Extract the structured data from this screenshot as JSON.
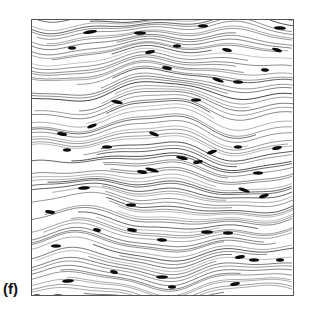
{
  "figure": {
    "panel_label": "(f)",
    "colors": {
      "line": "#3a3a3a",
      "marker": "#0a0a0a",
      "background": "#ffffff",
      "frame": "#555555"
    },
    "streamline_count": 95,
    "markers": [
      [
        58,
        12,
        14,
        -2
      ],
      [
        108,
        13,
        12,
        0
      ],
      [
        171,
        6,
        10,
        0
      ],
      [
        248,
        8,
        12,
        1
      ],
      [
        145,
        26,
        8,
        0
      ],
      [
        118,
        32,
        10,
        -3
      ],
      [
        195,
        30,
        10,
        3
      ],
      [
        40,
        28,
        8,
        0
      ],
      [
        245,
        30,
        10,
        4
      ],
      [
        135,
        48,
        10,
        2
      ],
      [
        233,
        50,
        8,
        1
      ],
      [
        186,
        60,
        12,
        5
      ],
      [
        206,
        62,
        10,
        1
      ],
      [
        85,
        82,
        12,
        3
      ],
      [
        164,
        80,
        10,
        0
      ],
      [
        60,
        106,
        10,
        -5
      ],
      [
        30,
        114,
        10,
        2
      ],
      [
        122,
        114,
        10,
        5
      ],
      [
        75,
        127,
        10,
        0
      ],
      [
        35,
        130,
        8,
        0
      ],
      [
        180,
        132,
        10,
        -4
      ],
      [
        206,
        127,
        8,
        0
      ],
      [
        245,
        128,
        10,
        -3
      ],
      [
        120,
        150,
        14,
        4
      ],
      [
        150,
        138,
        12,
        3
      ],
      [
        166,
        142,
        10,
        -2
      ],
      [
        110,
        152,
        10,
        2
      ],
      [
        226,
        153,
        10,
        0
      ],
      [
        52,
        168,
        12,
        -1
      ],
      [
        18,
        192,
        10,
        2
      ],
      [
        99,
        185,
        10,
        0
      ],
      [
        212,
        170,
        12,
        5
      ],
      [
        232,
        176,
        10,
        -4
      ],
      [
        65,
        210,
        8,
        3
      ],
      [
        100,
        210,
        10,
        2
      ],
      [
        130,
        220,
        10,
        1
      ],
      [
        175,
        212,
        12,
        0
      ],
      [
        196,
        213,
        10,
        0
      ],
      [
        24,
        226,
        10,
        0
      ],
      [
        208,
        237,
        10,
        -2
      ],
      [
        130,
        257,
        12,
        0
      ],
      [
        203,
        264,
        10,
        -3
      ],
      [
        222,
        240,
        10,
        0
      ],
      [
        36,
        261,
        12,
        -1
      ],
      [
        82,
        252,
        8,
        4
      ],
      [
        140,
        267,
        8,
        0
      ],
      [
        26,
        276,
        12,
        0
      ],
      [
        178,
        288,
        12,
        0
      ],
      [
        5,
        276,
        8,
        0
      ],
      [
        248,
        240,
        8,
        0
      ]
    ]
  }
}
